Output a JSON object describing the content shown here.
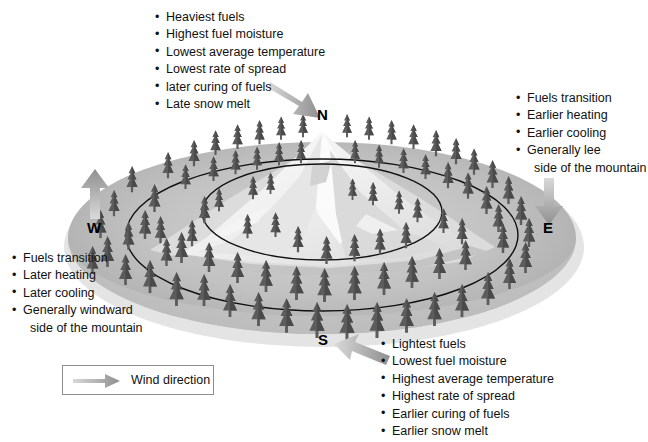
{
  "diagram": {
    "colors": {
      "background": "#ffffff",
      "base_ellipse": "#b4b4b4",
      "base_ellipse_light": "#c9c9c9",
      "mountain_snow": "#f2f2f2",
      "mountain_shadow": "#cfcfcf",
      "tree": "#5e5e5e",
      "contour_line": "#111111",
      "arrow": "#a8a8a8",
      "text": "#111111",
      "legend_border": "#8d8d8d"
    }
  },
  "compass": {
    "north": "N",
    "east": "E",
    "south": "S",
    "west": "W"
  },
  "blocks": {
    "north": {
      "aspect": "N",
      "items": [
        "Heaviest fuels",
        "Highest fuel moisture",
        "Lowest average temperature",
        "Lowest rate of spread",
        "later curing of fuels",
        "Late snow melt"
      ]
    },
    "east": {
      "aspect": "E",
      "items": [
        "Fuels transition",
        "Earlier heating",
        "Earlier cooling",
        "Generally lee"
      ],
      "continuation": "side of the mountain"
    },
    "west": {
      "aspect": "W",
      "items": [
        "Fuels transition",
        "Later heating",
        "Later cooling",
        "Generally windward"
      ],
      "continuation": "side of the mountain"
    },
    "south": {
      "aspect": "S",
      "items": [
        "Lightest fuels",
        "Lowest fuel moisture",
        "Highest average temperature",
        "Highest rate of spread",
        "Earlier curing of fuels",
        "Earlier snow melt"
      ]
    }
  },
  "legend": {
    "label": "Wind direction",
    "icon": "wind-arrow-icon"
  },
  "arrows": {
    "north": {
      "name": "wind-arrow-north",
      "direction": "down-right"
    },
    "east": {
      "name": "wind-arrow-east",
      "direction": "down"
    },
    "west": {
      "name": "wind-arrow-west",
      "direction": "up"
    },
    "south": {
      "name": "wind-arrow-south",
      "direction": "up-left"
    }
  }
}
